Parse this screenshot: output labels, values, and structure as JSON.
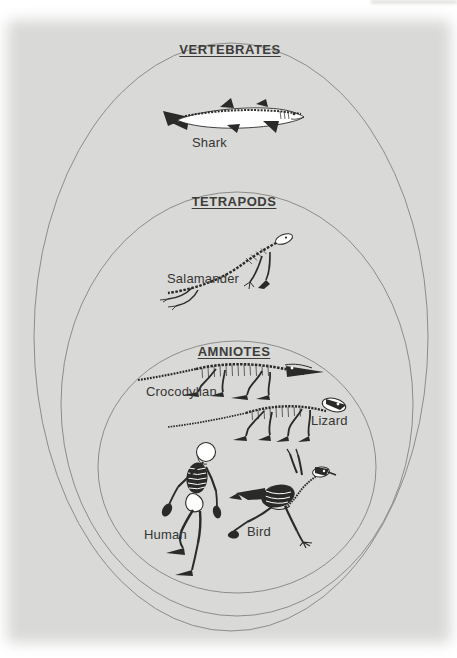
{
  "figure": {
    "groups": [
      {
        "id": "vertebrates",
        "label": "VERTEBRATES"
      },
      {
        "id": "tetrapods",
        "label": "TETRAPODS"
      },
      {
        "id": "amniotes",
        "label": "AMNIOTES"
      }
    ],
    "animals": [
      {
        "id": "shark",
        "label": "Shark"
      },
      {
        "id": "salamander",
        "label": "Salamander"
      },
      {
        "id": "crocodylian",
        "label": "Crocodylian"
      },
      {
        "id": "lizard",
        "label": "Lizard"
      },
      {
        "id": "human",
        "label": "Human"
      },
      {
        "id": "bird",
        "label": "Bird"
      }
    ],
    "colors": {
      "panel_bg": "#d9d9d7",
      "ellipse_stroke": "#8c8c8a",
      "heading_text": "#3c3c3a",
      "label_text": "#353533",
      "skeleton_ink": "#2a2a28"
    }
  }
}
